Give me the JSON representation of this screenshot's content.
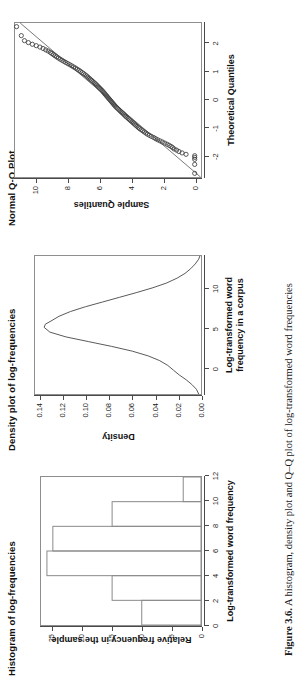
{
  "figure": {
    "caption_label": "Figure 3.6.",
    "caption_text": "A histogram, density plot and Q–Q plot of log-transformed word frequencies"
  },
  "panels": [
    {
      "id": "histogram",
      "title": "Histogram of log-frequencies",
      "xlabel": "Log-transformed word frequency",
      "ylabel": "Relative frequency in the sample"
    },
    {
      "id": "density",
      "title": "Density plot of log-frequencies",
      "xlabel_line1": "Log-transformed word",
      "xlabel_line2": "frequency in a corpus",
      "ylabel": "Density"
    },
    {
      "id": "qqplot",
      "title": "Normal Q-Q Plot",
      "xlabel": "Theoretical Quantiles",
      "ylabel": "Sample Quantiles"
    }
  ],
  "chart_data": [
    {
      "type": "bar",
      "id": "histogram",
      "title": "Histogram of log-frequencies",
      "xlabel": "Log-transformed word frequency",
      "ylabel": "Relative frequency in the sample",
      "xlim": [
        0,
        12
      ],
      "ylim": [
        0,
        27
      ],
      "xticks": [
        0,
        2,
        4,
        6,
        8,
        10,
        12
      ],
      "yticks": [
        0,
        5,
        10,
        15,
        20,
        25
      ],
      "bin_edges": [
        0,
        2,
        4,
        6,
        8,
        10,
        12
      ],
      "categories": [
        "0-2",
        "2-4",
        "4-6",
        "6-8",
        "8-10",
        "10-12"
      ],
      "values": [
        10,
        15,
        26,
        25,
        15,
        3
      ],
      "grid": false,
      "legend": "none"
    },
    {
      "type": "line",
      "id": "density",
      "title": "Density plot of log-frequencies",
      "xlabel": "Log-transformed word frequency in a corpus",
      "ylabel": "Density",
      "xlim": [
        -3.2,
        14.2
      ],
      "ylim": [
        0,
        0.145
      ],
      "xticks": [
        0,
        5,
        10
      ],
      "yticks": [
        0.0,
        0.02,
        0.04,
        0.06,
        0.08,
        0.1,
        0.12,
        0.14
      ],
      "ytick_labels": [
        "0.00",
        "0.02",
        "0.04",
        "0.06",
        "0.08",
        "0.10",
        "0.12",
        "0.14"
      ],
      "x": [
        -3.2,
        -2.6,
        -2.0,
        -1.4,
        -0.8,
        -0.2,
        0.4,
        1.0,
        1.6,
        2.2,
        2.8,
        3.4,
        4.0,
        4.6,
        5.2,
        5.6,
        6.0,
        6.6,
        7.2,
        7.8,
        8.4,
        9.0,
        9.6,
        10.2,
        10.8,
        11.4,
        12.0,
        12.6,
        13.2,
        13.8,
        14.2
      ],
      "y": [
        0.002,
        0.004,
        0.008,
        0.013,
        0.019,
        0.024,
        0.029,
        0.036,
        0.046,
        0.06,
        0.078,
        0.098,
        0.118,
        0.132,
        0.137,
        0.136,
        0.131,
        0.124,
        0.114,
        0.101,
        0.086,
        0.071,
        0.056,
        0.042,
        0.03,
        0.021,
        0.014,
        0.009,
        0.005,
        0.002,
        0.001
      ],
      "grid": false,
      "legend": "none"
    },
    {
      "type": "scatter",
      "id": "qqplot",
      "title": "Normal Q-Q Plot",
      "xlabel": "Theoretical Quantiles",
      "ylabel": "Sample Quantiles",
      "xlim": [
        -2.75,
        2.75
      ],
      "ylim": [
        -0.4,
        11.4
      ],
      "xticks": [
        -2,
        -1,
        0,
        1,
        2
      ],
      "yticks": [
        0,
        2,
        4,
        6,
        8,
        10
      ],
      "reference_line": {
        "slope": 2.08,
        "intercept": 5.35
      },
      "points_x": [
        -2.62,
        -2.3,
        -2.12,
        -2.05,
        -1.99,
        -1.94,
        -1.89,
        -1.84,
        -1.79,
        -1.75,
        -1.7,
        -1.66,
        -1.62,
        -1.58,
        -1.54,
        -1.5,
        -1.46,
        -1.42,
        -1.38,
        -1.34,
        -1.3,
        -1.26,
        -1.22,
        -1.18,
        -1.14,
        -1.1,
        -1.06,
        -1.02,
        -0.98,
        -0.94,
        -0.9,
        -0.86,
        -0.82,
        -0.78,
        -0.74,
        -0.7,
        -0.66,
        -0.62,
        -0.58,
        -0.54,
        -0.5,
        -0.46,
        -0.42,
        -0.38,
        -0.34,
        -0.3,
        -0.26,
        -0.22,
        -0.18,
        -0.14,
        -0.1,
        -0.06,
        -0.02,
        0.02,
        0.06,
        0.1,
        0.14,
        0.18,
        0.22,
        0.26,
        0.3,
        0.34,
        0.38,
        0.42,
        0.46,
        0.5,
        0.54,
        0.58,
        0.62,
        0.66,
        0.7,
        0.74,
        0.78,
        0.82,
        0.86,
        0.9,
        0.94,
        0.98,
        1.02,
        1.06,
        1.1,
        1.14,
        1.18,
        1.22,
        1.26,
        1.3,
        1.34,
        1.38,
        1.42,
        1.46,
        1.5,
        1.54,
        1.58,
        1.62,
        1.66,
        1.7,
        1.75,
        1.79,
        1.84,
        1.89,
        1.94,
        1.99,
        2.05,
        2.12,
        2.3,
        2.62
      ],
      "points_y": [
        0.0,
        0.0,
        0.0,
        0.0,
        0.0,
        0.55,
        0.8,
        1.0,
        1.15,
        1.3,
        1.4,
        1.5,
        1.62,
        1.75,
        1.9,
        2.05,
        2.2,
        2.35,
        2.48,
        2.6,
        2.75,
        2.88,
        3.0,
        3.1,
        3.2,
        3.3,
        3.4,
        3.5,
        3.58,
        3.66,
        3.74,
        3.82,
        3.9,
        3.98,
        4.06,
        4.14,
        4.22,
        4.3,
        4.38,
        4.45,
        4.52,
        4.6,
        4.68,
        4.75,
        4.82,
        4.9,
        4.97,
        5.04,
        5.1,
        5.16,
        5.22,
        5.28,
        5.34,
        5.4,
        5.46,
        5.52,
        5.58,
        5.64,
        5.7,
        5.76,
        5.82,
        5.88,
        5.95,
        6.02,
        6.09,
        6.16,
        6.23,
        6.3,
        6.38,
        6.46,
        6.54,
        6.62,
        6.7,
        6.78,
        6.86,
        6.95,
        7.04,
        7.14,
        7.24,
        7.34,
        7.45,
        7.56,
        7.68,
        7.8,
        7.92,
        8.05,
        8.18,
        8.3,
        8.42,
        8.54,
        8.65,
        8.76,
        8.86,
        8.96,
        9.06,
        9.16,
        9.3,
        9.45,
        9.62,
        9.82,
        10.05,
        10.3,
        10.55,
        10.8,
        11.0,
        11.3
      ],
      "grid": false,
      "legend": "none"
    }
  ]
}
